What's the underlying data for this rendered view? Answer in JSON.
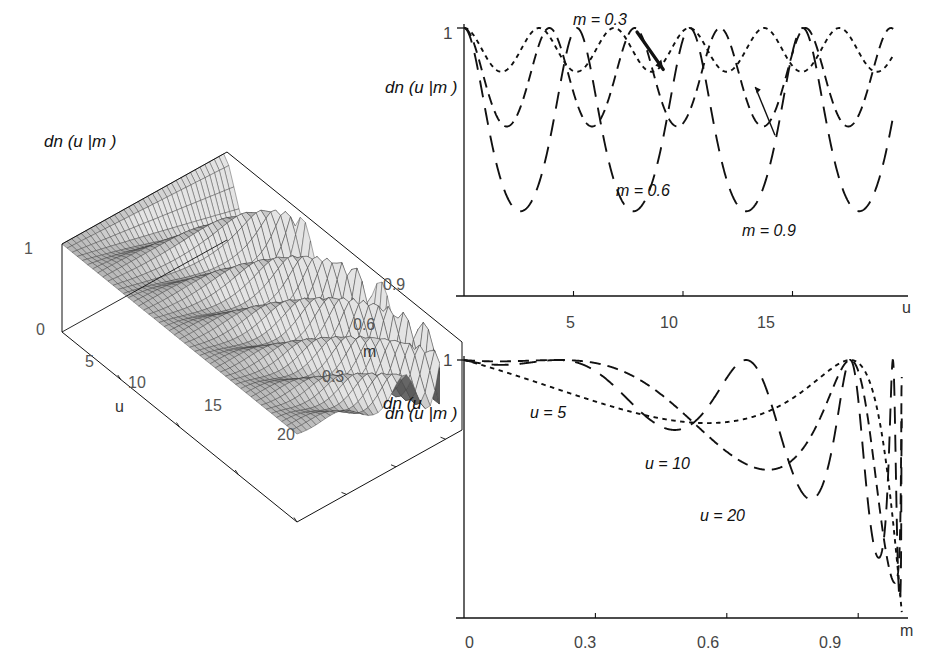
{
  "figure": {
    "kind": "three-panel scientific figure of the Jacobi elliptic function dn(u|m)",
    "function_label": "dn (u |m )"
  },
  "panel_3d": {
    "name": "surface-plot",
    "zlabel": "dn (u |m )",
    "corner_label": "dn (u",
    "z_ticks": [
      "1",
      "0"
    ],
    "u_axis": {
      "label": "u",
      "ticks": [
        "5",
        "10",
        "15",
        "20"
      ],
      "range": [
        0,
        20
      ]
    },
    "m_axis": {
      "label": "m",
      "ticks": [
        "0.3",
        "0.6",
        "0.9"
      ],
      "range": [
        0,
        1
      ]
    }
  },
  "chart_data": [
    {
      "id": "surface-dn-u-m",
      "type": "surface",
      "title": "",
      "zlabel": "dn (u |m )",
      "xlabel": "u",
      "ylabel": "m",
      "xlim": [
        0,
        20
      ],
      "ylim": [
        0,
        1
      ],
      "zlim": [
        0,
        1
      ],
      "xticks": [
        5,
        10,
        15,
        20
      ],
      "yticks": [
        0.3,
        0.6,
        0.9
      ],
      "zticks": [
        0,
        1
      ],
      "grid": false,
      "description": "dn(u|m) surface; flat near m=0 (value 1) and increasingly oscillatory with deeper minima as m approaches 1"
    },
    {
      "id": "dn-vs-u",
      "type": "line",
      "title": "",
      "xlabel": "u",
      "ylabel": "dn (u |m )",
      "xlim": [
        0,
        20
      ],
      "ylim": [
        0,
        1
      ],
      "xticks": [
        5,
        10,
        15
      ],
      "yticks": [
        1
      ],
      "ytick_labels": [
        "1"
      ],
      "grid": false,
      "legend_position": "inline-annotations",
      "series": [
        {
          "name": "m = 0.3",
          "style": "dotted",
          "minimum": 0.837,
          "period": 3.43,
          "annotation_xy": [
            7.2,
            1.06
          ]
        },
        {
          "name": "m = 0.6",
          "style": "dashed",
          "minimum": 0.632,
          "period": 3.84,
          "annotation_xy": [
            8.6,
            0.42
          ]
        },
        {
          "name": "m = 0.9",
          "style": "long-dash",
          "minimum": 0.316,
          "period": 5.16,
          "annotation_xy": [
            14.2,
            0.19
          ]
        }
      ]
    },
    {
      "id": "dn-vs-m",
      "type": "line",
      "title": "",
      "xlabel": "m",
      "ylabel": "dn (u |m )",
      "xlim": [
        0,
        1
      ],
      "ylim": [
        0,
        1
      ],
      "xticks": [
        0,
        0.3,
        0.6,
        0.9
      ],
      "yticks": [
        1
      ],
      "ytick_labels": [
        "1"
      ],
      "grid": false,
      "legend_position": "inline-annotations",
      "series": [
        {
          "name": "u = 5",
          "style": "dotted",
          "annotation_xy": [
            0.18,
            0.79
          ]
        },
        {
          "name": "u = 10",
          "style": "dashed",
          "annotation_xy": [
            0.52,
            0.57
          ]
        },
        {
          "name": "u = 20",
          "style": "long-dash",
          "annotation_xy": [
            0.64,
            0.38
          ]
        }
      ]
    }
  ],
  "chart_top": {
    "ytick_1": "1",
    "ylabel": "dn (u |m )",
    "xlabel": "u",
    "xticks": [
      "5",
      "10",
      "15"
    ],
    "annotations": [
      "m = 0.3",
      "m = 0.6",
      "m = 0.9"
    ]
  },
  "chart_bottom": {
    "ytick_1": "1",
    "ylabel": "dn (u |m )",
    "xlabel": "m",
    "xticks": [
      "0",
      "0.3",
      "0.6",
      "0.9"
    ],
    "annotations": [
      "u = 5",
      "u = 10",
      "u = 20"
    ]
  },
  "colors": {
    "ink": "#111111",
    "background": "#ffffff",
    "surface_light": "#d8d8d8",
    "surface_mid": "#a8a8a8",
    "surface_dark": "#555555"
  }
}
